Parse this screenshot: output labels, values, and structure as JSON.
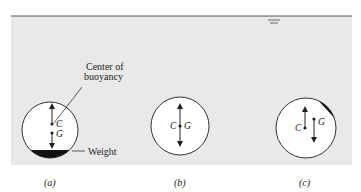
{
  "figure": {
    "colors": {
      "background": "#ffffff",
      "water": "#e9e9e9",
      "surface_line": "#555555",
      "stroke": "#333333",
      "weight_fill": "#111111"
    },
    "water_level_symbol": "water-surface-marker",
    "panels": [
      {
        "id": "a",
        "caption": "(a)",
        "label_c": "C",
        "label_g": "G",
        "annotations": {
          "buoyancy_line1": "Center of",
          "buoyancy_line2": "buoyancy",
          "weight": "Weight"
        },
        "weight_position": "bottom",
        "description": "Stable: G below C"
      },
      {
        "id": "b",
        "caption": "(b)",
        "label_c": "C",
        "label_g": "G",
        "weight_position": "none",
        "description": "Neutral: C and G coincide"
      },
      {
        "id": "c",
        "caption": "(c)",
        "label_c": "C",
        "label_g": "G",
        "weight_position": "upper-right",
        "description": "Unstable: G above/offset from C"
      }
    ]
  }
}
